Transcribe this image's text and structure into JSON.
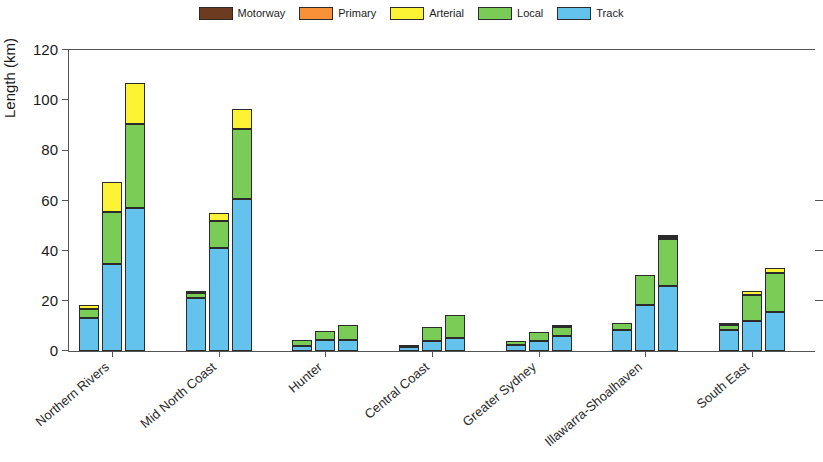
{
  "chart_data": {
    "type": "bar",
    "subtype": "stacked-grouped",
    "title": "",
    "xlabel": "",
    "ylabel": "Length (km)",
    "ylim": [
      0,
      120
    ],
    "ytick_values": [
      0,
      20,
      40,
      60,
      80,
      100,
      120
    ],
    "ytick_labels": [
      "0",
      "20",
      "40",
      "60",
      "80",
      "100",
      "120"
    ],
    "grid": false,
    "legend_position": "top-center",
    "legend": [
      "Motorway",
      "Primary",
      "Arterial",
      "Local",
      "Track"
    ],
    "colors": {
      "Motorway": "#6d3b20",
      "Primary": "#f79238",
      "Arterial": "#fdf335",
      "Local": "#79cc56",
      "Track": "#63c3ec",
      "outline": "#2b2b2b",
      "axis": "#555555",
      "text": "#1a1a1a",
      "background": "#ffffff"
    },
    "categories": [
      "Northern Rivers",
      "Mid North Coast",
      "Hunter",
      "Central Coast",
      "Greater Sydney",
      "Illawarra-Shoalhaven",
      "South East"
    ],
    "bars_per_category": 3,
    "series_order": [
      "Track",
      "Local",
      "Arterial",
      "Primary",
      "Motorway"
    ],
    "groups": [
      {
        "category": "Northern Rivers",
        "bars": [
          {
            "Track": 13.0,
            "Local": 3.8,
            "Arterial": 1.7,
            "Primary": 0.0,
            "Motorway": 0.0,
            "total": 18.5
          },
          {
            "Track": 34.5,
            "Local": 21.0,
            "Arterial": 12.0,
            "Primary": 0.0,
            "Motorway": 0.0,
            "total": 67.5
          },
          {
            "Track": 57.0,
            "Local": 33.5,
            "Arterial": 16.5,
            "Primary": 0.0,
            "Motorway": 0.0,
            "total": 107.0
          }
        ]
      },
      {
        "category": "Mid North Coast",
        "bars": [
          {
            "Track": 21.0,
            "Local": 2.0,
            "Arterial": 1.0,
            "Primary": 0.0,
            "Motorway": 0.0,
            "total": 24.0
          },
          {
            "Track": 41.0,
            "Local": 11.0,
            "Arterial": 3.0,
            "Primary": 0.0,
            "Motorway": 0.0,
            "total": 55.0
          },
          {
            "Track": 60.5,
            "Local": 28.0,
            "Arterial": 8.0,
            "Primary": 0.0,
            "Motorway": 0.0,
            "total": 96.5
          }
        ]
      },
      {
        "category": "Hunter",
        "bars": [
          {
            "Track": 2.0,
            "Local": 2.5,
            "Arterial": 0.0,
            "Primary": 0.0,
            "Motorway": 0.0,
            "total": 4.5
          },
          {
            "Track": 4.5,
            "Local": 3.5,
            "Arterial": 0.0,
            "Primary": 0.0,
            "Motorway": 0.0,
            "total": 8.0
          },
          {
            "Track": 4.5,
            "Local": 6.0,
            "Arterial": 0.0,
            "Primary": 0.0,
            "Motorway": 0.0,
            "total": 10.5
          }
        ]
      },
      {
        "category": "Central Coast",
        "bars": [
          {
            "Track": 1.5,
            "Local": 1.0,
            "Arterial": 0.0,
            "Primary": 0.0,
            "Motorway": 0.0,
            "total": 2.5
          },
          {
            "Track": 4.0,
            "Local": 5.5,
            "Arterial": 0.0,
            "Primary": 0.0,
            "Motorway": 0.0,
            "total": 9.5
          },
          {
            "Track": 5.0,
            "Local": 9.5,
            "Arterial": 0.0,
            "Primary": 0.0,
            "Motorway": 0.0,
            "total": 14.5
          }
        ]
      },
      {
        "category": "Greater Sydney",
        "bars": [
          {
            "Track": 2.5,
            "Local": 1.5,
            "Arterial": 0.0,
            "Primary": 0.0,
            "Motorway": 0.0,
            "total": 4.0
          },
          {
            "Track": 4.0,
            "Local": 3.5,
            "Arterial": 0.0,
            "Primary": 0.0,
            "Motorway": 0.0,
            "total": 7.5
          },
          {
            "Track": 6.0,
            "Local": 3.5,
            "Arterial": 1.0,
            "Primary": 0.0,
            "Motorway": 0.0,
            "total": 10.5
          }
        ]
      },
      {
        "category": "Illawarra-Shoalhaven",
        "bars": [
          {
            "Track": 8.5,
            "Local": 2.5,
            "Arterial": 0.0,
            "Primary": 0.0,
            "Motorway": 0.0,
            "total": 11.0
          },
          {
            "Track": 18.5,
            "Local": 12.0,
            "Arterial": 0.0,
            "Primary": 0.0,
            "Motorway": 0.0,
            "total": 30.5
          },
          {
            "Track": 26.0,
            "Local": 18.5,
            "Arterial": 1.0,
            "Primary": 0.0,
            "Motorway": 0.5,
            "total": 46.0
          }
        ]
      },
      {
        "category": "South East",
        "bars": [
          {
            "Track": 8.5,
            "Local": 2.0,
            "Arterial": 0.0,
            "Primary": 0.0,
            "Motorway": 0.5,
            "total": 11.0
          },
          {
            "Track": 12.0,
            "Local": 10.5,
            "Arterial": 1.5,
            "Primary": 0.0,
            "Motorway": 0.0,
            "total": 24.0
          },
          {
            "Track": 15.5,
            "Local": 15.5,
            "Arterial": 2.0,
            "Primary": 0.0,
            "Motorway": 0.0,
            "total": 33.0
          }
        ]
      }
    ]
  }
}
